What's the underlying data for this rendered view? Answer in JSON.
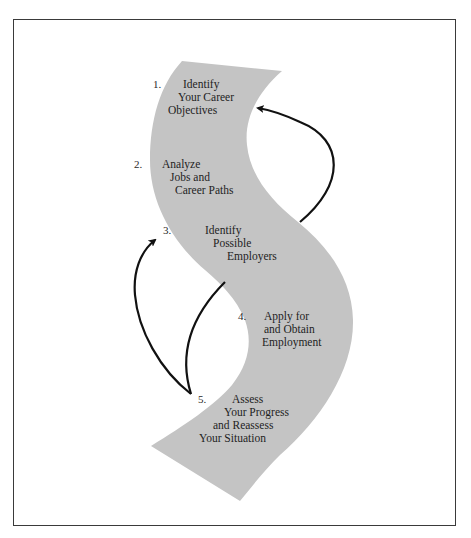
{
  "colors": {
    "band": "#c4c4c4",
    "arrow": "#111111",
    "frame": "#3a3a3a",
    "text": "#1e1e1e"
  },
  "steps": [
    {
      "number": "1.",
      "lines": [
        "Identify",
        "Your Career",
        "Objectives"
      ]
    },
    {
      "number": "2.",
      "lines": [
        "Analyze",
        "Jobs and",
        "Career Paths"
      ]
    },
    {
      "number": "3.",
      "lines": [
        "Identify",
        "Possible",
        "Employers"
      ]
    },
    {
      "number": "4.",
      "lines": [
        "Apply for",
        "and Obtain",
        "Employment"
      ]
    },
    {
      "number": "5.",
      "lines": [
        "Assess",
        "Your Progress",
        "and Reassess",
        "Your Situation"
      ]
    }
  ],
  "arrows": [
    {
      "from": "step-3",
      "to": "step-1",
      "label": "feedback-to-objectives"
    },
    {
      "from": "step-5",
      "to": "step-3",
      "label": "feedback-to-employers"
    }
  ]
}
